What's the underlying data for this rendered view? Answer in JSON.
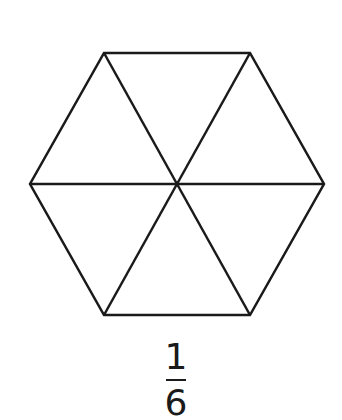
{
  "diagram": {
    "stroke_color": "#1a1a1a",
    "stroke_width": 2.5,
    "center": [
      177,
      184
    ],
    "vertices": [
      [
        104,
        53
      ],
      [
        250,
        53
      ],
      [
        324,
        184
      ],
      [
        250,
        315
      ],
      [
        104,
        315
      ],
      [
        30,
        184
      ]
    ],
    "parts": 6
  },
  "fraction": {
    "numerator": "1",
    "denominator": "6"
  }
}
